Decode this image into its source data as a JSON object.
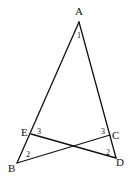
{
  "diagram": {
    "type": "geometry",
    "points": {
      "A": {
        "label": "A",
        "x": 79,
        "y": 22
      },
      "B": {
        "label": "B",
        "x": 17,
        "y": 163
      },
      "C": {
        "label": "C",
        "x": 110,
        "y": 135
      },
      "D": {
        "label": "D",
        "x": 116,
        "y": 158
      },
      "E": {
        "label": "E",
        "x": 31,
        "y": 134
      }
    },
    "segments": [
      "AB",
      "AD",
      "EC? no: ED",
      "BC"
    ],
    "angle_labels": {
      "angle1": "1",
      "angle3_left": "3",
      "angle3_right": "3",
      "angle2_left": "2",
      "angle2_right": "2"
    }
  }
}
